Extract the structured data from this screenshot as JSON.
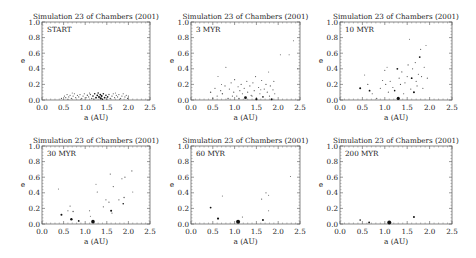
{
  "figure": {
    "width": 476,
    "height": 258
  },
  "chart_data": [
    {
      "type": "scatter",
      "title": "Simulation 23 of Chambers (2001)",
      "annotation": "START",
      "xlabel": "a (AU)",
      "ylabel": "e",
      "xlim": [
        0.0,
        2.5
      ],
      "ylim": [
        0.0,
        1.0
      ],
      "xticks": [
        "0.0",
        "0.5",
        "1.0",
        "1.5",
        "2.0",
        "2.5"
      ],
      "yticks": [
        "0.0",
        "0.2",
        "0.4",
        "0.6",
        "0.8",
        "1.0"
      ],
      "grid": false,
      "box": {
        "x0": 42,
        "x1": 150,
        "y0": 22,
        "y1": 100
      },
      "points": [
        [
          0.45,
          0.02,
          0.6
        ],
        [
          0.52,
          0.05,
          0.6
        ],
        [
          0.55,
          0.03,
          0.6
        ],
        [
          0.58,
          0.07,
          0.6
        ],
        [
          0.62,
          0.04,
          0.6
        ],
        [
          0.65,
          0.06,
          0.6
        ],
        [
          0.68,
          0.02,
          0.6
        ],
        [
          0.72,
          0.05,
          0.6
        ],
        [
          0.75,
          0.08,
          0.6
        ],
        [
          0.78,
          0.03,
          0.6
        ],
        [
          0.82,
          0.06,
          0.6
        ],
        [
          0.85,
          0.04,
          0.6
        ],
        [
          0.88,
          0.07,
          0.6
        ],
        [
          0.92,
          0.02,
          0.6
        ],
        [
          0.95,
          0.05,
          0.6
        ],
        [
          0.98,
          0.08,
          0.6
        ],
        [
          1.02,
          0.03,
          0.6
        ],
        [
          1.05,
          0.06,
          0.7
        ],
        [
          1.08,
          0.04,
          0.6
        ],
        [
          1.12,
          0.07,
          0.7
        ],
        [
          1.15,
          0.02,
          0.7
        ],
        [
          1.18,
          0.05,
          0.8
        ],
        [
          1.22,
          0.08,
          0.8
        ],
        [
          1.25,
          0.03,
          0.9
        ],
        [
          1.28,
          0.06,
          0.9
        ],
        [
          1.32,
          0.04,
          1.0
        ],
        [
          1.35,
          0.07,
          0.9
        ],
        [
          1.38,
          0.05,
          1.0
        ],
        [
          1.42,
          0.08,
          0.8
        ],
        [
          1.45,
          0.03,
          0.9
        ],
        [
          1.48,
          0.06,
          0.8
        ],
        [
          1.52,
          0.04,
          0.8
        ],
        [
          1.55,
          0.07,
          0.7
        ],
        [
          1.58,
          0.02,
          0.7
        ],
        [
          1.62,
          0.05,
          0.7
        ],
        [
          1.65,
          0.08,
          0.6
        ],
        [
          1.68,
          0.03,
          0.6
        ],
        [
          1.72,
          0.06,
          0.6
        ],
        [
          1.75,
          0.04,
          0.6
        ],
        [
          1.78,
          0.07,
          0.6
        ],
        [
          1.82,
          0.02,
          0.6
        ],
        [
          1.85,
          0.05,
          0.6
        ],
        [
          1.88,
          0.08,
          0.6
        ],
        [
          1.92,
          0.04,
          0.6
        ],
        [
          1.95,
          0.06,
          0.6
        ],
        [
          1.98,
          0.02,
          0.6
        ],
        [
          2.0,
          0.05,
          0.6
        ],
        [
          0.6,
          0.01,
          0.5
        ],
        [
          0.9,
          0.01,
          0.5
        ],
        [
          1.2,
          0.01,
          0.6
        ],
        [
          1.5,
          0.01,
          0.6
        ],
        [
          1.8,
          0.01,
          0.5
        ],
        [
          1.3,
          0.09,
          0.8
        ],
        [
          1.4,
          0.01,
          0.8
        ],
        [
          1.1,
          0.09,
          0.6
        ],
        [
          0.7,
          0.09,
          0.5
        ],
        [
          1.7,
          0.09,
          0.5
        ],
        [
          1.36,
          0.02,
          1.1
        ]
      ]
    },
    {
      "type": "scatter",
      "title": "Simulation 23 of Chambers (2001)",
      "annotation": "3 MYR",
      "xlabel": "a (AU)",
      "ylabel": "e",
      "xlim": [
        0.0,
        2.5
      ],
      "ylim": [
        0.0,
        1.0
      ],
      "xticks": [
        "0.0",
        "0.5",
        "1.0",
        "1.5",
        "2.0",
        "2.5"
      ],
      "yticks": [
        "0.0",
        "0.2",
        "0.4",
        "0.6",
        "0.8",
        "1.0"
      ],
      "grid": false,
      "box": {
        "x0": 191,
        "x1": 300,
        "y0": 22,
        "y1": 100
      },
      "points": [
        [
          0.45,
          0.1,
          0.7
        ],
        [
          0.55,
          0.15,
          0.6
        ],
        [
          0.6,
          0.05,
          0.6
        ],
        [
          0.62,
          0.3,
          0.5
        ],
        [
          0.68,
          0.12,
          0.6
        ],
        [
          0.72,
          0.08,
          0.7
        ],
        [
          0.78,
          0.18,
          0.6
        ],
        [
          0.8,
          0.42,
          0.6
        ],
        [
          0.85,
          0.02,
          0.7
        ],
        [
          0.88,
          0.14,
          0.6
        ],
        [
          0.92,
          0.22,
          0.6
        ],
        [
          0.98,
          0.1,
          0.6
        ],
        [
          1.0,
          0.26,
          0.6
        ],
        [
          1.05,
          0.05,
          0.6
        ],
        [
          1.08,
          0.17,
          0.6
        ],
        [
          1.12,
          0.12,
          0.6
        ],
        [
          1.15,
          0.2,
          0.6
        ],
        [
          1.18,
          0.08,
          0.6
        ],
        [
          1.22,
          0.15,
          0.6
        ],
        [
          1.25,
          0.03,
          1.4
        ],
        [
          1.28,
          0.24,
          0.6
        ],
        [
          1.3,
          0.1,
          0.6
        ],
        [
          1.35,
          0.18,
          0.6
        ],
        [
          1.38,
          0.06,
          0.6
        ],
        [
          1.42,
          0.22,
          0.6
        ],
        [
          1.45,
          0.12,
          0.6
        ],
        [
          1.48,
          0.3,
          0.6
        ],
        [
          1.5,
          0.01,
          1.1
        ],
        [
          1.55,
          0.16,
          0.6
        ],
        [
          1.58,
          0.08,
          0.6
        ],
        [
          1.62,
          0.25,
          0.6
        ],
        [
          1.65,
          0.04,
          0.8
        ],
        [
          1.68,
          0.14,
          0.6
        ],
        [
          1.72,
          0.2,
          0.6
        ],
        [
          1.75,
          0.1,
          0.6
        ],
        [
          1.78,
          0.36,
          0.5
        ],
        [
          1.8,
          0.05,
          0.6
        ],
        [
          1.82,
          0.18,
          0.6
        ],
        [
          1.85,
          0.01,
          1.0
        ],
        [
          1.88,
          0.13,
          0.6
        ],
        [
          1.9,
          0.24,
          0.6
        ],
        [
          1.92,
          0.08,
          0.6
        ],
        [
          2.05,
          0.58,
          0.5
        ],
        [
          2.25,
          0.58,
          0.5
        ],
        [
          2.35,
          0.76,
          0.5
        ],
        [
          2.45,
          0.4,
          0.5
        ],
        [
          0.5,
          0.02,
          0.6
        ],
        [
          0.7,
          0.2,
          0.5
        ],
        [
          0.95,
          0.05,
          0.6
        ],
        [
          1.1,
          0.02,
          0.7
        ],
        [
          1.4,
          0.05,
          0.6
        ],
        [
          1.6,
          0.13,
          0.5
        ]
      ]
    },
    {
      "type": "scatter",
      "title": "Simulation 23 of Chambers (2001)",
      "annotation": "10 MYR",
      "xlabel": "a (AU)",
      "ylabel": "e",
      "xlim": [
        0.0,
        2.5
      ],
      "ylim": [
        0.0,
        1.0
      ],
      "xticks": [
        "0.0",
        "0.5",
        "1.0",
        "1.5",
        "2.0",
        "2.5"
      ],
      "yticks": [
        "0.0",
        "0.2",
        "0.4",
        "0.6",
        "0.8",
        "1.0"
      ],
      "grid": false,
      "box": {
        "x0": 340,
        "x1": 452,
        "y0": 22,
        "y1": 100
      },
      "points": [
        [
          0.45,
          0.15,
          1.0
        ],
        [
          0.55,
          0.32,
          0.5
        ],
        [
          0.62,
          0.2,
          0.6
        ],
        [
          0.66,
          0.12,
          0.9
        ],
        [
          0.72,
          0.08,
          0.6
        ],
        [
          0.82,
          0.02,
          0.6
        ],
        [
          0.9,
          0.15,
          0.6
        ],
        [
          0.95,
          0.25,
          0.6
        ],
        [
          1.0,
          0.38,
          0.6
        ],
        [
          1.02,
          0.2,
          0.6
        ],
        [
          1.05,
          0.42,
          0.5
        ],
        [
          1.08,
          0.1,
          0.6
        ],
        [
          1.12,
          0.24,
          0.6
        ],
        [
          1.18,
          0.16,
          0.6
        ],
        [
          1.22,
          0.12,
          0.8
        ],
        [
          1.28,
          0.4,
          0.9
        ],
        [
          1.3,
          0.02,
          1.6
        ],
        [
          1.32,
          0.28,
          0.6
        ],
        [
          1.35,
          0.2,
          0.6
        ],
        [
          1.38,
          0.36,
          0.6
        ],
        [
          1.42,
          0.08,
          0.6
        ],
        [
          1.45,
          0.22,
          0.6
        ],
        [
          1.5,
          0.3,
          0.6
        ],
        [
          1.52,
          0.45,
          0.6
        ],
        [
          1.55,
          0.78,
          0.5
        ],
        [
          1.58,
          0.14,
          0.6
        ],
        [
          1.6,
          0.28,
          0.9
        ],
        [
          1.62,
          0.4,
          0.6
        ],
        [
          1.65,
          0.1,
          1.0
        ],
        [
          1.68,
          0.48,
          0.6
        ],
        [
          1.7,
          0.24,
          0.6
        ],
        [
          1.72,
          0.18,
          0.6
        ],
        [
          1.75,
          0.33,
          0.6
        ],
        [
          1.78,
          0.55,
          0.9
        ],
        [
          1.8,
          0.65,
          0.6
        ],
        [
          1.82,
          0.3,
          0.6
        ],
        [
          1.85,
          0.15,
          0.6
        ],
        [
          1.88,
          0.42,
          0.6
        ],
        [
          1.92,
          0.7,
          0.5
        ],
        [
          1.95,
          0.28,
          0.6
        ]
      ]
    },
    {
      "type": "scatter",
      "title": "Simulation 23 of Chambers (2001)",
      "annotation": "30 MYR",
      "xlabel": "a (AU)",
      "ylabel": "e",
      "xlim": [
        0.0,
        2.5
      ],
      "ylim": [
        0.0,
        1.0
      ],
      "xticks": [
        "0.0",
        "0.5",
        "1.0",
        "1.5",
        "2.0",
        "2.5"
      ],
      "yticks": [
        "0.0",
        "0.2",
        "0.4",
        "0.6",
        "0.8",
        "1.0"
      ],
      "grid": false,
      "box": {
        "x0": 42,
        "x1": 150,
        "y0": 146,
        "y1": 224
      },
      "points": [
        [
          0.38,
          0.45,
          0.5
        ],
        [
          0.45,
          0.12,
          1.0
        ],
        [
          0.6,
          0.17,
          0.6
        ],
        [
          0.65,
          0.23,
          0.6
        ],
        [
          0.68,
          0.06,
          1.2
        ],
        [
          0.72,
          0.16,
          0.7
        ],
        [
          0.85,
          0.04,
          0.9
        ],
        [
          1.1,
          0.17,
          0.6
        ],
        [
          1.12,
          0.1,
          0.5
        ],
        [
          1.18,
          0.03,
          1.8
        ],
        [
          1.25,
          0.51,
          0.5
        ],
        [
          1.28,
          0.41,
          0.6
        ],
        [
          1.42,
          0.22,
          0.6
        ],
        [
          1.48,
          0.31,
          0.6
        ],
        [
          1.55,
          0.28,
          0.6
        ],
        [
          1.58,
          0.64,
          0.6
        ],
        [
          1.6,
          0.17,
          1.0
        ],
        [
          1.62,
          0.14,
          0.6
        ],
        [
          1.65,
          0.48,
          0.6
        ],
        [
          1.78,
          0.31,
          0.6
        ],
        [
          1.85,
          0.58,
          0.6
        ],
        [
          1.88,
          0.26,
          0.8
        ],
        [
          1.9,
          0.34,
          0.7
        ],
        [
          1.92,
          0.6,
          0.6
        ],
        [
          2.08,
          0.68,
          0.6
        ],
        [
          2.1,
          0.41,
          0.5
        ]
      ]
    },
    {
      "type": "scatter",
      "title": "Simulation 23 of Chambers (2001)",
      "annotation": "60 MYR",
      "xlabel": "a (AU)",
      "ylabel": "e",
      "xlim": [
        0.0,
        2.5
      ],
      "ylim": [
        0.0,
        1.0
      ],
      "xticks": [
        "0.0",
        "0.5",
        "1.0",
        "1.5",
        "2.0",
        "2.5"
      ],
      "yticks": [
        "0.0",
        "0.2",
        "0.4",
        "0.6",
        "0.8",
        "1.0"
      ],
      "grid": false,
      "box": {
        "x0": 191,
        "x1": 300,
        "y0": 146,
        "y1": 224
      },
      "points": [
        [
          0.45,
          0.21,
          0.9
        ],
        [
          0.62,
          0.07,
          1.1
        ],
        [
          0.72,
          0.36,
          0.5
        ],
        [
          1.08,
          0.03,
          2.0
        ],
        [
          1.18,
          0.09,
          0.6
        ],
        [
          1.62,
          0.32,
          0.6
        ],
        [
          1.65,
          0.05,
          1.0
        ],
        [
          1.72,
          0.4,
          0.6
        ],
        [
          1.78,
          0.37,
          0.5
        ],
        [
          1.78,
          0.17,
          0.5
        ],
        [
          2.28,
          0.61,
          0.5
        ]
      ]
    },
    {
      "type": "scatter",
      "title": "Simulation 23 of Chambers (2001)",
      "annotation": "200 MYR",
      "xlabel": "a (AU)",
      "ylabel": "e",
      "xlim": [
        0.0,
        2.5
      ],
      "ylim": [
        0.0,
        1.0
      ],
      "xticks": [
        "0.0",
        "0.5",
        "1.0",
        "1.5",
        "2.0",
        "2.5"
      ],
      "yticks": [
        "0.0",
        "0.2",
        "0.4",
        "0.6",
        "0.8",
        "1.0"
      ],
      "grid": false,
      "box": {
        "x0": 340,
        "x1": 452,
        "y0": 146,
        "y1": 224
      },
      "points": [
        [
          0.45,
          0.05,
          0.8
        ],
        [
          0.65,
          0.02,
          0.9
        ],
        [
          1.1,
          0.02,
          2.0
        ],
        [
          1.65,
          0.09,
          1.0
        ]
      ]
    }
  ]
}
